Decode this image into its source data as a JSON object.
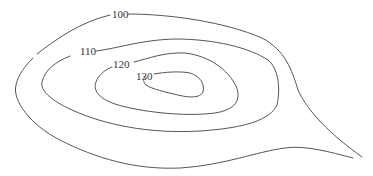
{
  "diagram": {
    "type": "contour-map",
    "line_color": "#555555",
    "label_color": "#333333",
    "background": "#ffffff",
    "contours": [
      {
        "value": "100",
        "label": "100"
      },
      {
        "value": "110",
        "label": "110"
      },
      {
        "value": "120",
        "label": "120"
      },
      {
        "value": "130",
        "label": "130"
      }
    ]
  }
}
